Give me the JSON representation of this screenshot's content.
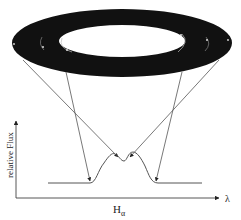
{
  "diagram": {
    "disk": {
      "outer": {
        "cx": 122,
        "cy": 43,
        "rx": 110,
        "ry": 34
      },
      "inner": {
        "cx": 122,
        "cy": 41,
        "rx": 63,
        "ry": 16
      },
      "color": "#111111"
    },
    "axes": {
      "y_label": "relative Flux",
      "x_label_main": "H",
      "x_label_sub": "α",
      "x_arrow_label": "λ"
    },
    "profile": {
      "baseline_y": 183,
      "x_start": 48,
      "x_end": 202,
      "peaks": [
        {
          "x": 115,
          "y": 154
        },
        {
          "x": 133,
          "y": 152
        }
      ],
      "center_dip": {
        "x": 124,
        "y": 161
      }
    },
    "line_color": "#555555"
  }
}
